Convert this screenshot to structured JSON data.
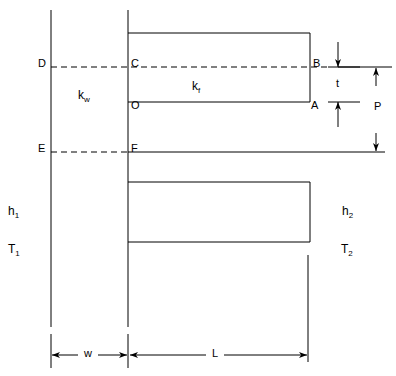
{
  "diagram": {
    "type": "engineering-cross-section",
    "colors": {
      "line": "#000000",
      "background": "#ffffff"
    },
    "point_labels": [
      {
        "name": "D",
        "text": "D",
        "x": 38,
        "y": 58
      },
      {
        "name": "C",
        "text": "C",
        "x": 131,
        "y": 58
      },
      {
        "name": "B",
        "text": "B",
        "x": 313,
        "y": 58
      },
      {
        "name": "O",
        "text": "O",
        "x": 131,
        "y": 100
      },
      {
        "name": "A",
        "text": "A",
        "x": 311,
        "y": 100
      },
      {
        "name": "E",
        "text": "E",
        "x": 38,
        "y": 143
      },
      {
        "name": "F",
        "text": "F",
        "x": 131,
        "y": 143
      }
    ],
    "conductivity_labels": [
      {
        "name": "k-wall",
        "base": "k",
        "sub": "w",
        "x": 78,
        "y": 89
      },
      {
        "name": "k-fin",
        "base": "k",
        "sub": "f",
        "x": 192,
        "y": 80
      }
    ],
    "film_labels": [
      {
        "name": "h1",
        "base": "h",
        "sub": "1",
        "x": 8,
        "y": 205
      },
      {
        "name": "T1",
        "base": "T",
        "sub": "1",
        "x": 8,
        "y": 243
      },
      {
        "name": "h2",
        "base": "h",
        "sub": "2",
        "x": 342,
        "y": 205
      },
      {
        "name": "T2",
        "base": "T",
        "sub": "2",
        "x": 341,
        "y": 243
      }
    ],
    "dimension_labels": [
      {
        "name": "dim-t",
        "text": "t",
        "x": 336,
        "y": 78
      },
      {
        "name": "dim-P",
        "text": "P",
        "x": 374,
        "y": 101
      },
      {
        "name": "dim-w",
        "text": "w",
        "x": 84,
        "y": 348
      },
      {
        "name": "dim-L",
        "text": "L",
        "x": 212,
        "y": 348
      }
    ],
    "geometry": {
      "wall_left_x": 51,
      "wall_right_x": 128,
      "fin_right_x": 310,
      "wall_top_y": 10,
      "wall_bottom_y": 327,
      "upper_fin_top_y": 33,
      "upper_fin_bottom_y": 102,
      "centerline_y": 67,
      "base_line_y": 152,
      "lower_fin_top_y": 182,
      "lower_fin_bottom_y": 242,
      "base_line_right_x": 385,
      "t_dim_x": 338,
      "p_dim_x": 376,
      "dim_line_y": 355
    }
  }
}
